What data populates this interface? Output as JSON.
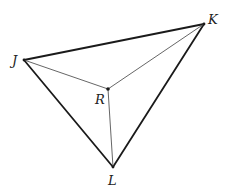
{
  "diagram": {
    "points": {
      "J": {
        "label": "J",
        "x": 24,
        "y": 60,
        "label_x": 12,
        "label_y": 65
      },
      "K": {
        "label": "K",
        "x": 204,
        "y": 24,
        "label_x": 208,
        "label_y": 24
      },
      "L": {
        "label": "L",
        "x": 113,
        "y": 167,
        "label_x": 108,
        "label_y": 185
      },
      "R": {
        "label": "R",
        "x": 108,
        "y": 89,
        "label_x": 95,
        "label_y": 104
      }
    },
    "outer_segments": [
      [
        "J",
        "K"
      ],
      [
        "K",
        "L"
      ],
      [
        "L",
        "J"
      ]
    ],
    "inner_segments": [
      [
        "R",
        "J"
      ],
      [
        "R",
        "K"
      ],
      [
        "R",
        "L"
      ]
    ],
    "colors": {
      "outer": "#1a1a1a",
      "inner": "#555555",
      "background": "#ffffff"
    }
  }
}
